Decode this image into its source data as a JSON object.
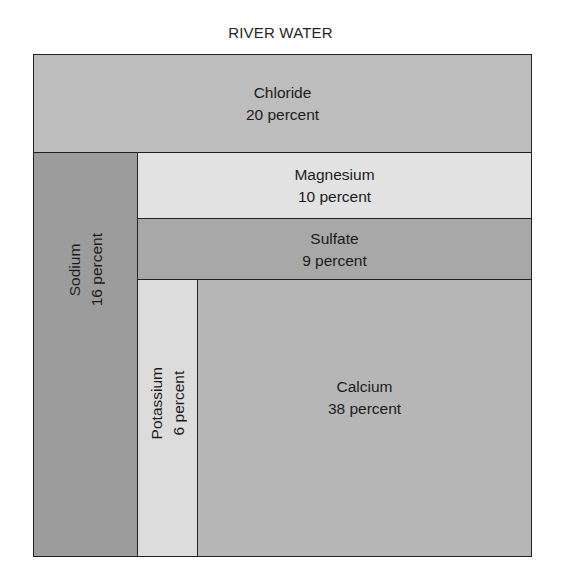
{
  "chart_data": {
    "type": "treemap",
    "title": "RIVER WATER",
    "unit": "percent",
    "categories": [
      "Chloride",
      "Sodium",
      "Magnesium",
      "Sulfate",
      "Potassium",
      "Calcium"
    ],
    "values": [
      20,
      16,
      10,
      9,
      6,
      38
    ],
    "labels": {
      "chloride": {
        "name": "Chloride",
        "value": "20 percent"
      },
      "sodium": {
        "name": "Sodium",
        "value": "16 percent"
      },
      "magnesium": {
        "name": "Magnesium",
        "value": "10 percent"
      },
      "sulfate": {
        "name": "Sulfate",
        "value": "9 percent"
      },
      "potassium": {
        "name": "Potassium",
        "value": "6 percent"
      },
      "calcium": {
        "name": "Calcium",
        "value": "38 percent"
      }
    },
    "colors": {
      "chloride": "#bdbdbd",
      "sodium": "#9c9c9c",
      "magnesium": "#e2e2e2",
      "sulfate": "#a8a8a8",
      "potassium": "#dcdcdc",
      "calcium": "#b6b6b6"
    },
    "legend": "none",
    "grid": false
  }
}
